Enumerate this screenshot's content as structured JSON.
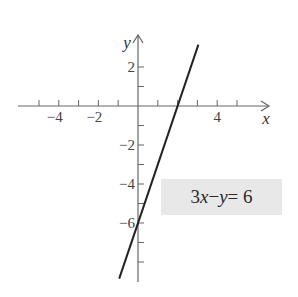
{
  "chart_data": {
    "type": "line",
    "title": "",
    "xlabel": "x",
    "ylabel": "y",
    "xlim": [
      -6,
      6.5
    ],
    "ylim": [
      -9,
      3.6
    ],
    "x_ticks": [
      -5,
      -4,
      -3,
      -2,
      -1,
      1,
      2,
      3,
      4,
      5
    ],
    "x_tick_labels": [
      {
        "value": -4,
        "label": "−4"
      },
      {
        "value": -2,
        "label": "−2"
      },
      {
        "value": 4,
        "label": "4"
      }
    ],
    "y_ticks": [
      2,
      1,
      -1,
      -2,
      -3,
      -4,
      -5,
      -6,
      -7,
      -8
    ],
    "y_tick_labels": [
      {
        "value": 2,
        "label": "2"
      },
      {
        "value": -2,
        "label": "−2"
      },
      {
        "value": -4,
        "label": "−4"
      },
      {
        "value": -6,
        "label": "−6"
      }
    ],
    "grid": false,
    "series": [
      {
        "name": "3x − y = 6",
        "equation": "y = 3x - 6",
        "x": [
          -0.95,
          3.05
        ],
        "y": [
          -8.85,
          3.15
        ],
        "color": "#222222"
      }
    ],
    "annotations": [
      {
        "text": "3x − y = 6",
        "position": [
          3.2,
          -5
        ],
        "background": "#e8e8e8"
      }
    ]
  },
  "labels": {
    "x_axis": "x",
    "y_axis": "y",
    "equation_parts": {
      "a": "3",
      "x": "x",
      "minus": " − ",
      "y": "y",
      "eq": " = 6"
    }
  }
}
